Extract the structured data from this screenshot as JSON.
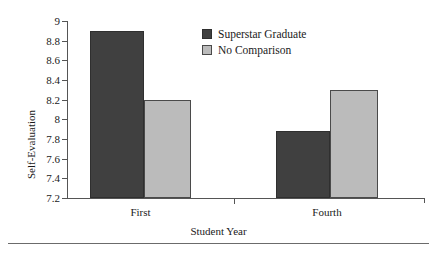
{
  "chart_data": {
    "type": "bar",
    "title": "",
    "xlabel": "Student Year",
    "ylabel": "Self-Evaluation",
    "categories": [
      "First",
      "Fourth"
    ],
    "series": [
      {
        "name": "Superstar Graduate",
        "color": "#404040",
        "values": [
          8.9,
          7.88
        ]
      },
      {
        "name": "No Comparison",
        "color": "#bbbbbb",
        "values": [
          8.2,
          8.3
        ]
      }
    ],
    "ylim": [
      7.2,
      9.0
    ],
    "ytick_step": 0.2,
    "yticks": [
      "9",
      "8.8",
      "8.6",
      "8.4",
      "8.2",
      "8",
      "7.8",
      "7.6",
      "7.4",
      "7.2"
    ],
    "grid": false,
    "legend_position": "top-center-right"
  },
  "axes": {
    "y_title": "Self-Evaluation",
    "x_title": "Student Year"
  },
  "legend": {
    "entries": [
      {
        "label": "Superstar Graduate",
        "swatch": "dark"
      },
      {
        "label": "No Comparison",
        "swatch": "light"
      }
    ]
  }
}
